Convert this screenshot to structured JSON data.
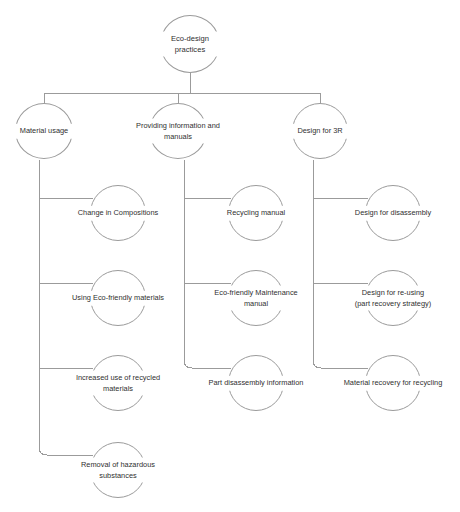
{
  "diagram": {
    "title": "Eco-design practices",
    "type": "hierarchy-tree",
    "node_shape": "ellipse",
    "colors": {
      "background": "#ffffff",
      "line": "#9b9b9b",
      "text": "#2f2f2f"
    },
    "root": {
      "id": "root",
      "label": "Eco-design practices",
      "cx": 190,
      "cy": 44,
      "rx": 30,
      "ry": 29,
      "label_width": 74
    },
    "branches": [
      {
        "id": "material-usage",
        "label": "Material usage",
        "cx": 44,
        "cy": 131,
        "rx": 29,
        "ry": 28,
        "label_width": 62,
        "trunk_x": 39,
        "trunk_top": 160,
        "trunk_bottom": 455,
        "children": [
          {
            "id": "change-in-compositions",
            "label": "Change in Compositions",
            "cx": 118,
            "cy": 213,
            "rx": 28,
            "ry": 28,
            "label_width": 94,
            "stem_y": 198
          },
          {
            "id": "using-eco-friendly-materials",
            "label": "Using Eco-friendly materials",
            "cx": 118,
            "cy": 298,
            "rx": 28,
            "ry": 28,
            "label_width": 100,
            "stem_y": 283
          },
          {
            "id": "increased-use-of-recycled-materials",
            "label": "Increased use of recycled\nmaterials",
            "cx": 118,
            "cy": 383,
            "rx": 28,
            "ry": 28,
            "label_width": 95,
            "stem_y": 368
          },
          {
            "id": "removal-of-hazardous-substances",
            "label": "Removal of hazardous\nsubstances",
            "cx": 118,
            "cy": 470,
            "rx": 28,
            "ry": 28,
            "label_width": 86,
            "stem_y": 455
          }
        ]
      },
      {
        "id": "providing-information-and-manuals",
        "label": "Providing information and\nmanuals",
        "cx": 178,
        "cy": 131,
        "rx": 29,
        "ry": 28,
        "label_width": 92,
        "trunk_x": 184,
        "trunk_top": 160,
        "trunk_bottom": 368,
        "children": [
          {
            "id": "recycling-manual",
            "label": "Recycling manual",
            "cx": 256,
            "cy": 213,
            "rx": 28,
            "ry": 28,
            "label_width": 72,
            "stem_y": 198
          },
          {
            "id": "eco-friendly-maintenance-manual",
            "label": "Eco-friendly Maintenance\nmanual",
            "cx": 256,
            "cy": 298,
            "rx": 28,
            "ry": 28,
            "label_width": 95,
            "stem_y": 283
          },
          {
            "id": "part-disassembly-information",
            "label": "Part disassembly information",
            "cx": 256,
            "cy": 383,
            "rx": 28,
            "ry": 28,
            "label_width": 104,
            "stem_y": 368
          }
        ]
      },
      {
        "id": "design-for-3r",
        "label": "Design for 3R",
        "cx": 320,
        "cy": 131,
        "rx": 28,
        "ry": 28,
        "label_width": 57,
        "trunk_x": 313,
        "trunk_top": 160,
        "trunk_bottom": 368,
        "children": [
          {
            "id": "design-for-disassembly",
            "label": "Design for disassembly",
            "cx": 393,
            "cy": 213,
            "rx": 28,
            "ry": 28,
            "label_width": 90,
            "stem_y": 198
          },
          {
            "id": "design-for-re-using",
            "label": "Design for re-using\n(part recovery strategy)",
            "cx": 393,
            "cy": 298,
            "rx": 28,
            "ry": 28,
            "label_width": 92,
            "stem_y": 283
          },
          {
            "id": "material-recovery-for-recycling",
            "label": "Material recovery for recycling",
            "cx": 393,
            "cy": 383,
            "rx": 28,
            "ry": 28,
            "label_width": 110,
            "stem_y": 368
          }
        ]
      }
    ],
    "root_connector": {
      "drop_from_root_y": 73,
      "bus_y": 93,
      "bus_left": 44,
      "bus_right": 320,
      "drop_to_y": 103
    }
  }
}
